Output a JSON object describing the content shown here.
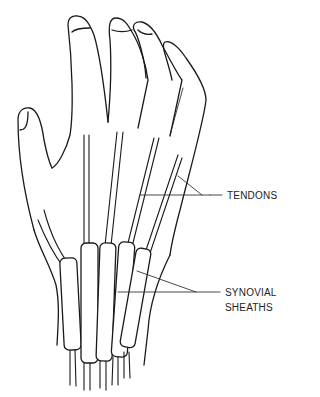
{
  "diagram": {
    "labels": {
      "tendons": "TENDONS",
      "synovial_line1": "SYNOVIAL",
      "synovial_line2": "SHEATHS"
    },
    "colors": {
      "stroke": "#1a1a1a",
      "background": "#ffffff"
    }
  }
}
